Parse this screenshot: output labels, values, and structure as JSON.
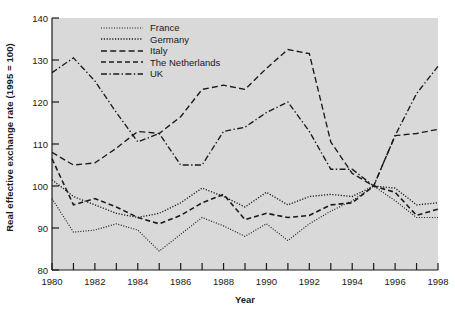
{
  "chart_data": {
    "type": "line",
    "title": "",
    "xlabel": "Year",
    "ylabel": "Real effective exchange rate (1995 = 100)",
    "xlim": [
      1980,
      1998
    ],
    "ylim": [
      80,
      140
    ],
    "yticks": [
      80,
      90,
      100,
      110,
      120,
      130,
      140
    ],
    "xticks": [
      1980,
      1981,
      1982,
      1983,
      1984,
      1985,
      1986,
      1987,
      1988,
      1989,
      1990,
      1991,
      1992,
      1993,
      1994,
      1995,
      1996,
      1997,
      1998
    ],
    "xtick_labels_shown": [
      1980,
      1982,
      1984,
      1986,
      1988,
      1990,
      1992,
      1994,
      1996,
      1998
    ],
    "grid": false,
    "legend_position": "top-left-inside",
    "plot_background": "#d9d9d9",
    "line_color": "#1a1a1a",
    "x": [
      1980,
      1981,
      1982,
      1983,
      1984,
      1985,
      1986,
      1987,
      1988,
      1989,
      1990,
      1991,
      1992,
      1993,
      1994,
      1995,
      1996,
      1997,
      1998
    ],
    "series": [
      {
        "name": "France",
        "dash": "dotted-fine",
        "values": [
          97.0,
          89.0,
          89.5,
          91.0,
          89.5,
          84.5,
          88.5,
          92.5,
          90.5,
          88.0,
          91.0,
          87.0,
          91.0,
          94.0,
          96.5,
          100.0,
          96.5,
          92.5,
          92.5
        ]
      },
      {
        "name": "Germany",
        "dash": "dotted",
        "values": [
          101.5,
          97.5,
          95.5,
          93.5,
          92.5,
          93.5,
          96.0,
          99.5,
          97.5,
          95.0,
          98.5,
          95.5,
          97.5,
          98.0,
          97.5,
          100.0,
          99.5,
          95.5,
          96.0
        ]
      },
      {
        "name": "Italy",
        "dash": "dashed-long",
        "values": [
          108.0,
          105.0,
          105.5,
          109.0,
          113.0,
          112.5,
          116.5,
          123.0,
          124.0,
          123.0,
          128.0,
          132.5,
          131.5,
          110.5,
          103.0,
          100.0,
          112.0,
          112.5,
          113.5
        ]
      },
      {
        "name": "The Netherlands",
        "dash": "dashed",
        "values": [
          106.5,
          95.5,
          97.0,
          95.0,
          92.5,
          91.0,
          93.0,
          96.0,
          98.0,
          92.0,
          93.5,
          92.5,
          93.0,
          95.5,
          96.0,
          100.0,
          98.5,
          93.0,
          94.5
        ]
      },
      {
        "name": "UK",
        "dash": "dash-dot",
        "values": [
          127.0,
          130.5,
          125.0,
          117.5,
          110.5,
          112.5,
          105.0,
          105.0,
          113.0,
          114.0,
          117.5,
          120.0,
          113.0,
          104.0,
          104.0,
          100.0,
          112.0,
          122.0,
          128.5
        ]
      }
    ]
  },
  "legend": {
    "items": [
      {
        "label": "France"
      },
      {
        "label": "Germany"
      },
      {
        "label": "Italy"
      },
      {
        "label": "The Netherlands"
      },
      {
        "label": "UK"
      }
    ]
  }
}
